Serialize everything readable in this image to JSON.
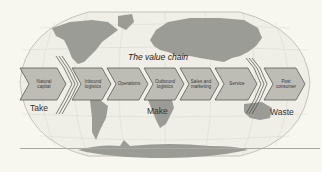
{
  "diagram": {
    "title": "The value chain",
    "phases": [
      {
        "label": "Take"
      },
      {
        "label": "Make"
      },
      {
        "label": "Waste"
      }
    ],
    "stages": [
      {
        "line1": "Natural",
        "line2": "capital",
        "phase": "Take"
      },
      {
        "line1": "Inbound",
        "line2": "logistics",
        "phase": "Make"
      },
      {
        "line1": "Operations",
        "line2": "",
        "phase": "Make"
      },
      {
        "line1": "Outbound",
        "line2": "logistics",
        "phase": "Make"
      },
      {
        "line1": "Sales and",
        "line2": "marketing",
        "phase": "Make"
      },
      {
        "line1": "Service",
        "line2": "",
        "phase": "Make"
      },
      {
        "line1": "Post",
        "line2": "consumer",
        "phase": "Waste"
      }
    ],
    "background": "world map",
    "colors": {
      "page": "#f7f6ef",
      "ocean": "#efeee7",
      "land": "#9c9c96",
      "chevron_fill": "#bdbdb6",
      "chevron_stroke": "#4a4a46",
      "text": "#333333"
    }
  }
}
